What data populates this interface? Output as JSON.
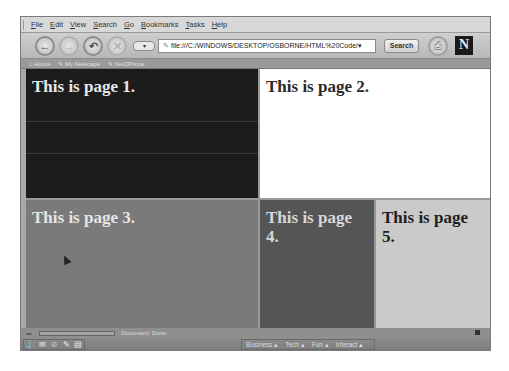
{
  "menubar": {
    "items": [
      "File",
      "Edit",
      "View",
      "Search",
      "Go",
      "Bookmarks",
      "Tasks",
      "Help"
    ]
  },
  "navbar": {
    "back_icon": "←",
    "forward_icon": "→",
    "reload_icon": "↶",
    "stop_icon": "✕",
    "dropdown_icon": "▾",
    "url": "file:///C:/WINDOWS/DESKTOP/OSBORNE/HTML%20Code/",
    "url_dropdown": "▾",
    "search_label": "Search",
    "print_icon": "⎙",
    "logo": "N"
  },
  "personal_toolbar": {
    "items": [
      "⌂ Home",
      "✎ My Netscape",
      "✎ Net2Phone"
    ]
  },
  "frames": [
    {
      "text": "This is page 1.",
      "bg": "#1c1c1c"
    },
    {
      "text": "This is page 2.",
      "bg": "#ffffff"
    },
    {
      "text": "This is page 3.",
      "bg": "#7a7a7a"
    },
    {
      "text": "This is page 4.",
      "bg": "#555555"
    },
    {
      "text": "This is page 5.",
      "bg": "#cacaca"
    }
  ],
  "statusbar": {
    "lock_icon": "═",
    "status_text": "Document: Done"
  },
  "componentbar": {
    "icons": [
      "⚓",
      "✉",
      "☺",
      "✎",
      "▤"
    ],
    "tabs": [
      "Business ▴",
      "Tech ▴",
      "Fun ▴",
      "Interact ▴"
    ]
  }
}
